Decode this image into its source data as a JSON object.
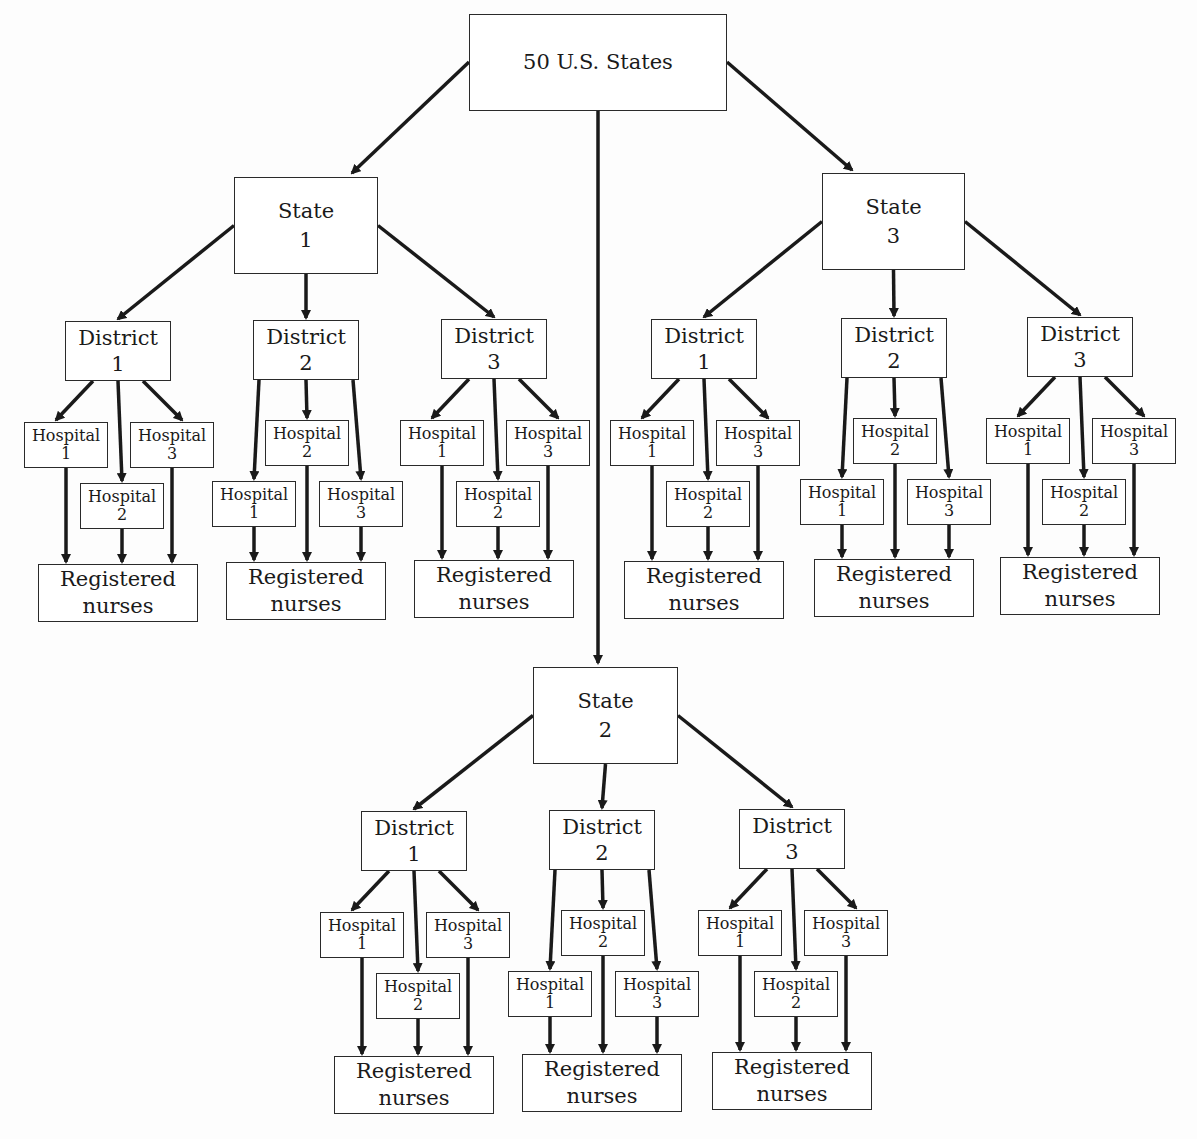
{
  "diagram": {
    "root": {
      "label": "50 U.S. States"
    },
    "labels": {
      "state_word": "State",
      "district_word": "District",
      "hospital_word": "Hospital",
      "rn_line1": "Registered",
      "rn_line2": "nurses"
    },
    "states": [
      {
        "number": "1",
        "districts": [
          {
            "number": "1",
            "hospitals": [
              "1",
              "2",
              "3"
            ],
            "leaf": "Registered nurses"
          },
          {
            "number": "2",
            "hospitals": [
              "1",
              "2",
              "3"
            ],
            "leaf": "Registered nurses"
          },
          {
            "number": "3",
            "hospitals": [
              "1",
              "2",
              "3"
            ],
            "leaf": "Registered nurses"
          }
        ]
      },
      {
        "number": "2",
        "districts": [
          {
            "number": "1",
            "hospitals": [
              "1",
              "2",
              "3"
            ],
            "leaf": "Registered nurses"
          },
          {
            "number": "2",
            "hospitals": [
              "1",
              "2",
              "3"
            ],
            "leaf": "Registered nurses"
          },
          {
            "number": "3",
            "hospitals": [
              "1",
              "2",
              "3"
            ],
            "leaf": "Registered nurses"
          }
        ]
      },
      {
        "number": "3",
        "districts": [
          {
            "number": "1",
            "hospitals": [
              "1",
              "2",
              "3"
            ],
            "leaf": "Registered nurses"
          },
          {
            "number": "2",
            "hospitals": [
              "1",
              "2",
              "3"
            ],
            "leaf": "Registered nurses"
          },
          {
            "number": "3",
            "hospitals": [
              "1",
              "2",
              "3"
            ],
            "leaf": "Registered nurses"
          }
        ]
      }
    ],
    "colors": {
      "line": "#1a1a1a",
      "box_border": "#2a2a2a",
      "background": "#fdfdfd"
    }
  }
}
